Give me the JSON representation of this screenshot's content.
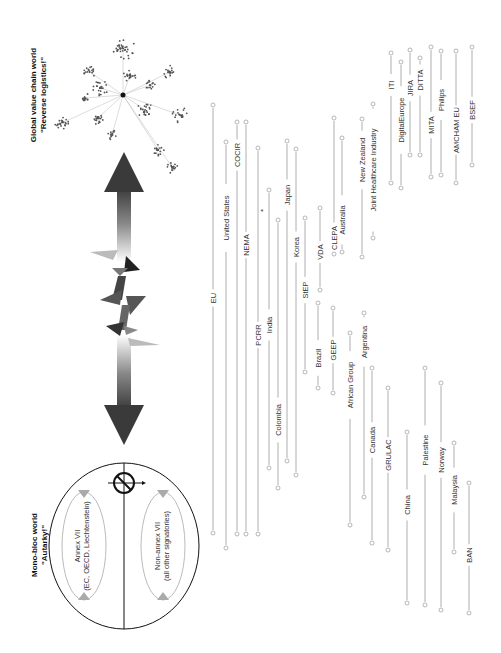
{
  "left_panel": {
    "title_line1": "Mono-bloc world",
    "title_line2": "\"Autarky!\"",
    "annex_label_line1": "Annex VII",
    "annex_label_line2": "(EC, OECD, Liechtenstein)",
    "nonannex_label_line1": "Non-annex VII",
    "nonannex_label_line2": "(all other signatories)",
    "icon": "prohibited-icon"
  },
  "right_panel": {
    "title_line1": "Global value chain world",
    "title_line2": "\"Reverse logistics!\"",
    "graphic": "network-graph"
  },
  "center": {
    "arrow": "double-headed-gradient-arrow",
    "break": "zigzag-shards"
  },
  "actors": [
    {
      "label": "EU"
    },
    {
      "label": "United States"
    },
    {
      "label": "COCIR"
    },
    {
      "label": "NEMA"
    },
    {
      "label": "PCRR"
    },
    {
      "label": "India"
    },
    {
      "label": "Colombia"
    },
    {
      "label": "Japan"
    },
    {
      "label": "Korea"
    },
    {
      "label": "StEP"
    },
    {
      "label": "Brazil"
    },
    {
      "label": "VDA"
    },
    {
      "label": "GEEP"
    },
    {
      "label": "CLEPA"
    },
    {
      "label": "Australia"
    },
    {
      "label": "African Group"
    },
    {
      "label": "Argentina"
    },
    {
      "label": "New Zealand"
    },
    {
      "label": "Canada"
    },
    {
      "label": "Joint Healthcare Industry"
    },
    {
      "label": "GRULAC"
    },
    {
      "label": "ITI"
    },
    {
      "label": "DigitalEurope"
    },
    {
      "label": "China"
    },
    {
      "label": "JIRA"
    },
    {
      "label": "DITTA"
    },
    {
      "label": "Palestine"
    },
    {
      "label": "MITA"
    },
    {
      "label": "Norway"
    },
    {
      "label": "Philips"
    },
    {
      "label": "Malaysia"
    },
    {
      "label": "AMCHAM EU"
    },
    {
      "label": "BSEF"
    },
    {
      "label": "BAN"
    }
  ],
  "asterisk": "*"
}
